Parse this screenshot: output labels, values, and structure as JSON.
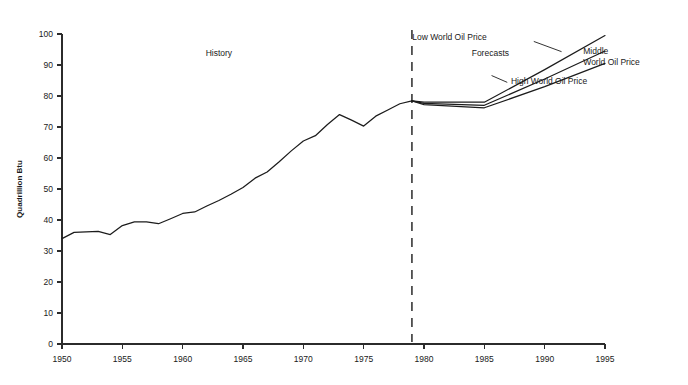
{
  "chart_data": {
    "type": "line",
    "title": "",
    "xlabel": "",
    "ylabel": "Quadrillion Btu",
    "xlim": [
      1950,
      1995
    ],
    "ylim": [
      0,
      100
    ],
    "grid": false,
    "legend_position": "inline-annotations",
    "x_ticks": [
      "1950",
      "1955",
      "1960",
      "1965",
      "1970",
      "1975",
      "1980",
      "1985",
      "1990",
      "1995"
    ],
    "x_tick_values": [
      1950,
      1955,
      1960,
      1965,
      1970,
      1975,
      1980,
      1985,
      1990,
      1995
    ],
    "y_ticks": [
      "0",
      "10",
      "20",
      "30",
      "40",
      "50",
      "60",
      "70",
      "80",
      "90",
      "100"
    ],
    "y_tick_values": [
      0,
      10,
      20,
      30,
      40,
      50,
      60,
      70,
      80,
      90,
      100
    ],
    "annotations": [
      {
        "text": "History",
        "x": 1963,
        "y": 93
      },
      {
        "text": "Forecasts",
        "x": 1985.5,
        "y": 93
      }
    ],
    "divider": {
      "x": 1979,
      "label": "history-forecast-divider"
    },
    "series": [
      {
        "name": "History",
        "x": [
          1950,
          1951,
          1952,
          1953,
          1954,
          1955,
          1956,
          1957,
          1958,
          1959,
          1960,
          1961,
          1962,
          1963,
          1964,
          1965,
          1966,
          1967,
          1968,
          1969,
          1970,
          1971,
          1972,
          1973,
          1974,
          1975,
          1976,
          1977,
          1978,
          1979
        ],
        "values": [
          34.0,
          36.0,
          36.2,
          36.3,
          35.3,
          38.2,
          39.4,
          39.4,
          38.8,
          40.4,
          42.1,
          42.6,
          44.5,
          46.3,
          48.3,
          50.5,
          53.5,
          55.5,
          58.8,
          62.3,
          65.5,
          67.2,
          70.8,
          74.0,
          72.2,
          70.3,
          73.5,
          75.5,
          77.5,
          78.4
        ]
      },
      {
        "name": "Low World Oil Price",
        "x": [
          1979,
          1980,
          1985,
          1990,
          1995
        ],
        "values": [
          78.4,
          78.0,
          78.0,
          88.5,
          99.5
        ]
      },
      {
        "name": "Middle World Oil Price",
        "x": [
          1979,
          1980,
          1985,
          1990,
          1995
        ],
        "values": [
          78.4,
          77.6,
          77.0,
          85.5,
          94.5
        ]
      },
      {
        "name": "High World Oil Price",
        "x": [
          1979,
          1980,
          1985,
          1990,
          1995
        ],
        "values": [
          78.4,
          77.2,
          76.2,
          83.0,
          90.5
        ]
      }
    ],
    "series_labels": [
      {
        "name": "low-world-oil-price",
        "lines": [
          "Low World Oil Price"
        ],
        "anchor_x": 1985.2,
        "anchor_y": 98.0
      },
      {
        "name": "middle-world-oil-price",
        "lines": [
          "Middle",
          "World Oil Price"
        ],
        "anchor_x": 1993.2,
        "anchor_y": 93.5
      },
      {
        "name": "high-world-oil-price",
        "lines": [
          "High World Oil Price"
        ],
        "anchor_x": 1987.2,
        "anchor_y": 84.0
      }
    ]
  }
}
